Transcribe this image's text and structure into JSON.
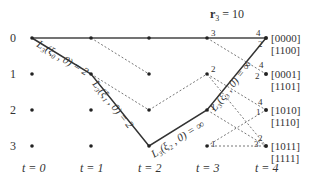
{
  "title_main": "r",
  "title_sub": "3",
  "title_rest": " = 10",
  "rows": [
    "0",
    "1",
    "2",
    "3"
  ],
  "time_labels": [
    "t = 0",
    "t = 1",
    "t = 2",
    "t = 3",
    "t = 4"
  ],
  "state_labels": [
    {
      "top": "[0000]",
      "bottom": "[1100]"
    },
    {
      "top": "[0001]",
      "bottom": "[1101]"
    },
    {
      "top": "[1010]",
      "bottom": "[1110]"
    },
    {
      "top": "[1011]",
      "bottom": "[1111]"
    }
  ],
  "path_labels": {
    "l0": "L₃(ξ₀ , 0) = 2",
    "l1": "L₃(ξ₁ , 0) = 2",
    "l2": "L₃(ξ₂ , 0) = ∞",
    "l3": "L₃(ξ₃ , 0) = ∞"
  },
  "branch_metrics": {
    "t3_r0": "3",
    "t4_r0_a": "4",
    "t4_r0_b": "2",
    "t3_r1": "2",
    "t4_r1_a": "4",
    "t4_r1_b": "2",
    "t3_r2": "1",
    "t4_r2_a": "4",
    "t4_r2_b": "1",
    "t3_r3": "1",
    "t4_r3_a": "2",
    "t4_r3_b": "3"
  }
}
